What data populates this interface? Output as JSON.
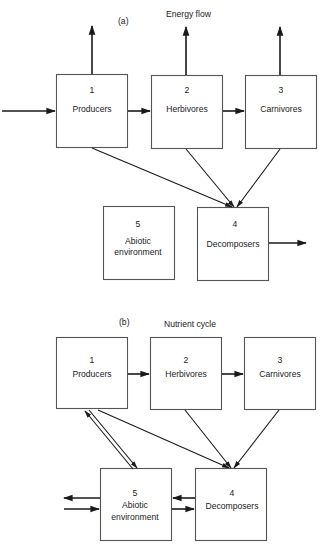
{
  "panel_a": {
    "label": "(a)",
    "title": "Energy flow",
    "boxes": {
      "producers": {
        "number": "1",
        "name": "Producers"
      },
      "herbivores": {
        "number": "2",
        "name": "Herbivores"
      },
      "carnivores": {
        "number": "3",
        "name": "Carnivores"
      },
      "decomposers": {
        "number": "4",
        "name": "Decomposers"
      },
      "abiotic": {
        "number": "5",
        "name_line1": "Abiotic",
        "name_line2": "environment"
      }
    },
    "flows": [
      {
        "from": "external",
        "to": "1"
      },
      {
        "from": "1",
        "to": "2"
      },
      {
        "from": "2",
        "to": "3"
      },
      {
        "from": "1",
        "to": "external-up"
      },
      {
        "from": "2",
        "to": "external-up"
      },
      {
        "from": "3",
        "to": "external-up"
      },
      {
        "from": "1",
        "to": "4"
      },
      {
        "from": "2",
        "to": "4"
      },
      {
        "from": "3",
        "to": "4"
      },
      {
        "from": "4",
        "to": "external-right"
      }
    ]
  },
  "panel_b": {
    "label": "(b)",
    "title": "Nutrient cycle",
    "boxes": {
      "producers": {
        "number": "1",
        "name": "Producers"
      },
      "herbivores": {
        "number": "2",
        "name": "Herbivores"
      },
      "carnivores": {
        "number": "3",
        "name": "Carnivores"
      },
      "decomposers": {
        "number": "4",
        "name": "Decomposers"
      },
      "abiotic": {
        "number": "5",
        "name_line1": "Abiotic",
        "name_line2": "environment"
      }
    },
    "flows": [
      {
        "from": "1",
        "to": "2"
      },
      {
        "from": "2",
        "to": "3"
      },
      {
        "from": "1",
        "to": "5"
      },
      {
        "from": "5",
        "to": "1"
      },
      {
        "from": "1",
        "to": "4"
      },
      {
        "from": "2",
        "to": "4"
      },
      {
        "from": "3",
        "to": "4"
      },
      {
        "from": "4",
        "to": "5"
      },
      {
        "from": "5",
        "to": "4"
      },
      {
        "from": "5",
        "to": "external-left"
      },
      {
        "from": "external-left",
        "to": "5"
      }
    ]
  }
}
